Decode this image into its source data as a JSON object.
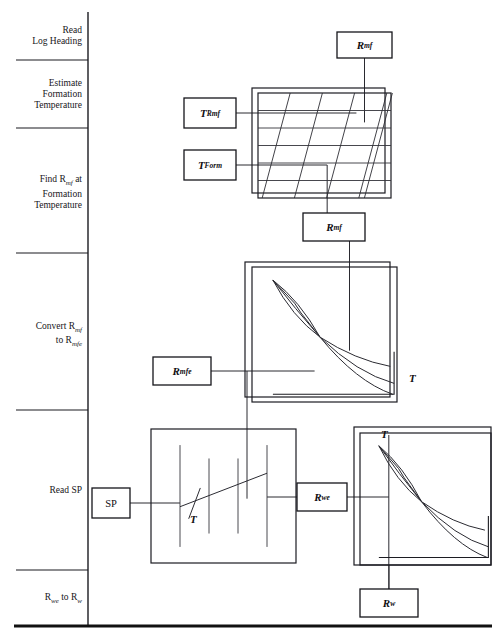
{
  "sidebar": {
    "divider_x": 88,
    "stages": [
      {
        "id": "read-log-heading",
        "lines": [
          "Read",
          "Log Heading"
        ],
        "y_top": 12,
        "y_bottom": 60
      },
      {
        "id": "estimate-formation-temperature",
        "lines": [
          "Estimate",
          "Formation",
          "Temperature"
        ],
        "y_top": 60,
        "y_bottom": 128
      },
      {
        "id": "find-rmf-at-formation-temperature",
        "lines": [
          "Find R<sub>mf</sub> at",
          "Formation",
          "Temperature"
        ],
        "y_top": 128,
        "y_bottom": 253
      },
      {
        "id": "convert-rmf-to-rmfe",
        "lines": [
          "Convert R<sub>mf</sub>",
          "to R<sub>mfe</sub>"
        ],
        "y_top": 253,
        "y_bottom": 410
      },
      {
        "id": "read-sp",
        "lines": [
          "Read SP"
        ],
        "y_top": 410,
        "y_bottom": 570
      },
      {
        "id": "rwe-to-rw",
        "lines": [
          "R<sub>we</sub> to R<sub>w</sub>"
        ],
        "y_top": 570,
        "y_bottom": 625
      }
    ]
  },
  "boxes": [
    {
      "id": "rmf-top",
      "label": "R<sub>mf</sub>",
      "x": 337,
      "y": 32,
      "w": 55,
      "h": 26,
      "italic": true
    },
    {
      "id": "t-rmf",
      "label": "T<sub>Rmf</sub>",
      "x": 184,
      "y": 98,
      "w": 52,
      "h": 30,
      "italic": true
    },
    {
      "id": "t-form",
      "label": "T<sub>Form</sub>",
      "x": 184,
      "y": 150,
      "w": 52,
      "h": 30,
      "italic": true
    },
    {
      "id": "rmf-mid",
      "label": "R<sub>mf</sub>",
      "x": 303,
      "y": 213,
      "w": 62,
      "h": 28,
      "italic": true
    },
    {
      "id": "rmfe",
      "label": "R<sub>mfe</sub>",
      "x": 153,
      "y": 357,
      "w": 58,
      "h": 28,
      "italic": true
    },
    {
      "id": "sp",
      "label": "SP",
      "x": 92,
      "y": 488,
      "w": 38,
      "h": 30,
      "italic": false
    },
    {
      "id": "rwe",
      "label": "R<sub>we</sub>",
      "x": 297,
      "y": 483,
      "w": 50,
      "h": 28,
      "italic": true
    },
    {
      "id": "rw",
      "label": "R<sub>w</sub>",
      "x": 360,
      "y": 589,
      "w": 58,
      "h": 28,
      "italic": true
    }
  ],
  "tmarks": [
    {
      "id": "t-chart2",
      "label": "T",
      "x": 409,
      "y": 372
    },
    {
      "id": "t-sp-chart",
      "label": "T",
      "x": 190,
      "y": 513
    },
    {
      "id": "t-chart3",
      "label": "T",
      "x": 381,
      "y": 428
    }
  ],
  "charts": [
    {
      "id": "rmf-temperature-nomograph",
      "type": "nomograph",
      "outer": {
        "x": 252,
        "y": 88,
        "w": 133,
        "h": 105
      },
      "inner": {
        "x": 258,
        "y": 93,
        "w": 133,
        "h": 105
      },
      "horizontal_lines": 5,
      "diagonal_lines": 6,
      "slant": 28
    },
    {
      "id": "rmf-to-rmfe-chart",
      "type": "curve-fan",
      "outer": {
        "x": 245,
        "y": 262,
        "w": 145,
        "h": 135
      },
      "inner": {
        "x": 252,
        "y": 267,
        "w": 145,
        "h": 135
      },
      "curves": 3
    },
    {
      "id": "sp-chart",
      "type": "sp-grid",
      "outer": {
        "x": 151,
        "y": 429,
        "w": 145,
        "h": 134
      },
      "vertical_lines": 4,
      "trend_line": true
    },
    {
      "id": "rwe-to-rw-chart",
      "type": "curve-fan",
      "outer": {
        "x": 354,
        "y": 427,
        "w": 137,
        "h": 138
      },
      "inner": {
        "x": 360,
        "y": 433,
        "w": 131,
        "h": 132
      },
      "curves": 3
    }
  ],
  "chart_data": {
    "type": "line",
    "charts": [
      {
        "id": "rmf-temperature-nomograph",
        "type": "heatmap",
        "title": "Resistivity of mud filtrate vs temperature",
        "xlabel": "Temperature",
        "ylabel": "Resistivity",
        "grid": true,
        "horizontal_gridlines": 5,
        "diagonal_isoresistivity_lines": 6,
        "inputs": [
          "T_Rmf",
          "T_Form"
        ],
        "outputs": [
          "R_mf"
        ]
      },
      {
        "id": "rmf-to-rmfe-chart",
        "type": "line",
        "title": "Rmf to Rmfe conversion",
        "xlabel": "Resistivity",
        "ylabel": "Equivalent resistivity",
        "grid": false,
        "series": [
          {
            "name": "curve-1",
            "x": [
              0.06,
              0.22,
              0.4,
              0.58,
              0.78,
              1.0
            ],
            "values": [
              0.97,
              0.74,
              0.53,
              0.36,
              0.22,
              0.1
            ]
          },
          {
            "name": "curve-2",
            "x": [
              0.06,
              0.22,
              0.4,
              0.58,
              0.78,
              1.0
            ],
            "values": [
              0.97,
              0.8,
              0.53,
              0.31,
              0.17,
              0.07
            ]
          },
          {
            "name": "curve-3",
            "x": [
              0.06,
              0.22,
              0.4,
              0.58,
              0.78,
              1.0
            ],
            "values": [
              0.97,
              0.69,
              0.53,
              0.41,
              0.3,
              0.22
            ]
          }
        ],
        "annotations": [
          "T"
        ],
        "inputs": [
          "R_mf"
        ],
        "outputs": [
          "R_mfe"
        ]
      },
      {
        "id": "sp-chart",
        "type": "line",
        "title": "SP to Rwe",
        "xlabel": "SP deflection",
        "ylabel": "Rmfe / Rwe ratio",
        "grid": true,
        "vertical_gridlines": 4,
        "series": [
          {
            "name": "sp-trend",
            "x": [
              0.0,
              0.25,
              0.6,
              1.0
            ],
            "values": [
              0.42,
              0.5,
              0.7,
              0.88
            ]
          }
        ],
        "annotations": [
          "T"
        ],
        "inputs": [
          "SP",
          "R_mfe"
        ],
        "outputs": [
          "R_we"
        ]
      },
      {
        "id": "rwe-to-rw-chart",
        "type": "line",
        "title": "Rwe to Rw conversion",
        "xlabel": "Equivalent water resistivity",
        "ylabel": "Water resistivity",
        "grid": false,
        "series": [
          {
            "name": "curve-1",
            "x": [
              0.05,
              0.22,
              0.42,
              0.62,
              0.82,
              1.0
            ],
            "values": [
              0.95,
              0.72,
              0.5,
              0.34,
              0.22,
              0.14
            ]
          },
          {
            "name": "curve-2",
            "x": [
              0.05,
              0.22,
              0.42,
              0.62,
              0.82,
              1.0
            ],
            "values": [
              0.95,
              0.78,
              0.5,
              0.29,
              0.16,
              0.08
            ]
          },
          {
            "name": "curve-3",
            "x": [
              0.05,
              0.22,
              0.42,
              0.62,
              0.82,
              1.0
            ],
            "values": [
              0.95,
              0.66,
              0.5,
              0.4,
              0.31,
              0.25
            ]
          }
        ],
        "annotations": [
          "T"
        ],
        "inputs": [
          "R_we"
        ],
        "outputs": [
          "R_w"
        ]
      }
    ]
  }
}
